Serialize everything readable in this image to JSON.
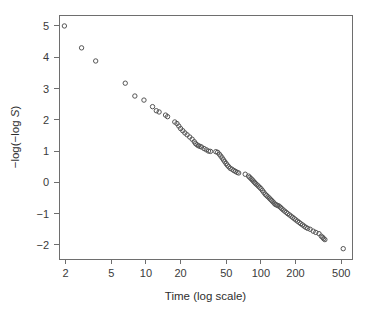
{
  "chart_data": {
    "type": "scatter",
    "title": "",
    "xlabel": "Time (log scale)",
    "ylabel": "-log(-log S)",
    "ylabel_parts": {
      "prefix": "−log(−log ",
      "italic": "S",
      "suffix": ")"
    },
    "xscale": "log",
    "yscale": "linear",
    "xlim": [
      1.75,
      620
    ],
    "ylim": [
      -2.45,
      5.35
    ],
    "grid": false,
    "legend": null,
    "marker": "open-circle",
    "marker_radius": 2.2,
    "marker_color": "#555555",
    "xticks": [
      2,
      5,
      10,
      20,
      50,
      100,
      200,
      500
    ],
    "xticklabels": [
      "2",
      "5",
      "10",
      "20",
      "50",
      "100",
      "200",
      "500"
    ],
    "yticks": [
      -2,
      -1,
      0,
      1,
      2,
      3,
      4,
      5
    ],
    "yticklabels": [
      "−2",
      "−1",
      "0",
      "1",
      "2",
      "3",
      "4",
      "5"
    ],
    "points": [
      [
        1.95,
        5.0
      ],
      [
        2.75,
        4.3
      ],
      [
        3.65,
        3.88
      ],
      [
        6.6,
        3.17
      ],
      [
        8.0,
        2.76
      ],
      [
        9.6,
        2.63
      ],
      [
        11.4,
        2.42
      ],
      [
        12.3,
        2.29
      ],
      [
        13.0,
        2.25
      ],
      [
        14.8,
        2.15
      ],
      [
        15.4,
        2.1
      ],
      [
        17.8,
        1.93
      ],
      [
        18.6,
        1.88
      ],
      [
        19.3,
        1.8
      ],
      [
        20.0,
        1.72
      ],
      [
        20.9,
        1.65
      ],
      [
        21.8,
        1.58
      ],
      [
        22.8,
        1.52
      ],
      [
        24.0,
        1.45
      ],
      [
        25.2,
        1.38
      ],
      [
        26.3,
        1.3
      ],
      [
        27.0,
        1.24
      ],
      [
        27.8,
        1.2
      ],
      [
        28.6,
        1.17
      ],
      [
        29.5,
        1.15
      ],
      [
        30.4,
        1.13
      ],
      [
        32.0,
        1.08
      ],
      [
        33.5,
        1.04
      ],
      [
        35.0,
        1.0
      ],
      [
        36.4,
        0.99
      ],
      [
        40.5,
        0.98
      ],
      [
        42.0,
        0.96
      ],
      [
        43.5,
        0.9
      ],
      [
        44.8,
        0.84
      ],
      [
        46.0,
        0.78
      ],
      [
        47.2,
        0.72
      ],
      [
        48.5,
        0.66
      ],
      [
        49.8,
        0.6
      ],
      [
        51.0,
        0.55
      ],
      [
        52.5,
        0.5
      ],
      [
        54.0,
        0.45
      ],
      [
        56.0,
        0.42
      ],
      [
        58.0,
        0.38
      ],
      [
        60.0,
        0.35
      ],
      [
        62.0,
        0.32
      ],
      [
        64.0,
        0.3
      ],
      [
        73.0,
        0.26
      ],
      [
        78.0,
        0.2
      ],
      [
        80.0,
        0.16
      ],
      [
        82.0,
        0.12
      ],
      [
        84.0,
        0.08
      ],
      [
        86.0,
        0.04
      ],
      [
        88.0,
        0.0
      ],
      [
        90.0,
        -0.04
      ],
      [
        92.5,
        -0.08
      ],
      [
        95.0,
        -0.12
      ],
      [
        97.5,
        -0.16
      ],
      [
        100.0,
        -0.2
      ],
      [
        103.0,
        -0.26
      ],
      [
        106.0,
        -0.32
      ],
      [
        109.0,
        -0.38
      ],
      [
        112.0,
        -0.42
      ],
      [
        115.0,
        -0.46
      ],
      [
        118.0,
        -0.5
      ],
      [
        121.0,
        -0.54
      ],
      [
        124.0,
        -0.58
      ],
      [
        127.0,
        -0.62
      ],
      [
        130.0,
        -0.66
      ],
      [
        133.0,
        -0.7
      ],
      [
        136.0,
        -0.72
      ],
      [
        140.0,
        -0.74
      ],
      [
        144.0,
        -0.76
      ],
      [
        148.0,
        -0.8
      ],
      [
        152.0,
        -0.84
      ],
      [
        156.0,
        -0.88
      ],
      [
        161.0,
        -0.92
      ],
      [
        166.0,
        -0.96
      ],
      [
        171.0,
        -1.0
      ],
      [
        177.0,
        -1.04
      ],
      [
        183.0,
        -1.08
      ],
      [
        189.0,
        -1.12
      ],
      [
        195.0,
        -1.16
      ],
      [
        201.0,
        -1.2
      ],
      [
        208.0,
        -1.24
      ],
      [
        215.0,
        -1.28
      ],
      [
        222.0,
        -1.32
      ],
      [
        230.0,
        -1.36
      ],
      [
        238.0,
        -1.4
      ],
      [
        246.0,
        -1.44
      ],
      [
        255.0,
        -1.47
      ],
      [
        268.0,
        -1.5
      ],
      [
        285.0,
        -1.56
      ],
      [
        300.0,
        -1.6
      ],
      [
        320.0,
        -1.64
      ],
      [
        335.0,
        -1.72
      ],
      [
        345.0,
        -1.76
      ],
      [
        352.0,
        -1.8
      ],
      [
        360.0,
        -1.83
      ],
      [
        520.0,
        -2.12
      ]
    ]
  },
  "colors": {
    "background": "#ffffff",
    "axis": "#6e6e6e",
    "text": "#2e2e2e",
    "marker": "#555555"
  }
}
